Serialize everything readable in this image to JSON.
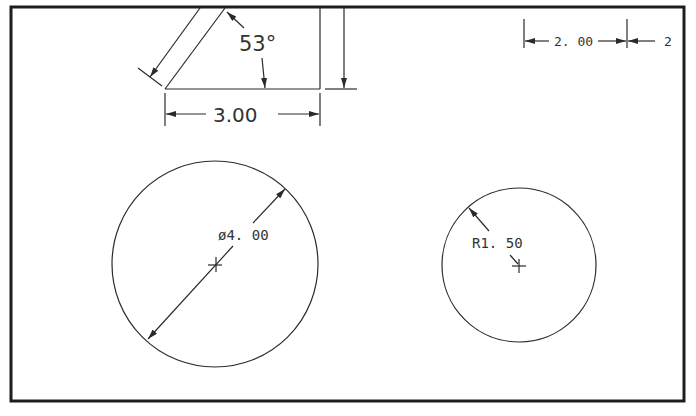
{
  "drawing": {
    "frame": {
      "x": 11,
      "y": 7,
      "w": 673,
      "h": 394
    },
    "colors": {
      "line": "#2a2a2a",
      "frame": "#1e1e1e",
      "text": "#333333",
      "background": "#ffffff"
    }
  },
  "triangle_view": {
    "angle_label": "53°",
    "width_label": "3.00"
  },
  "linear_dimension": {
    "label": "2. 00",
    "label_continued": "2"
  },
  "large_circle": {
    "diameter_label": "ø4. 00",
    "center": [
      215,
      264
    ],
    "radius": 103
  },
  "small_circle": {
    "radius_label": "R1. 50",
    "center": [
      519,
      265
    ],
    "radius": 77
  }
}
